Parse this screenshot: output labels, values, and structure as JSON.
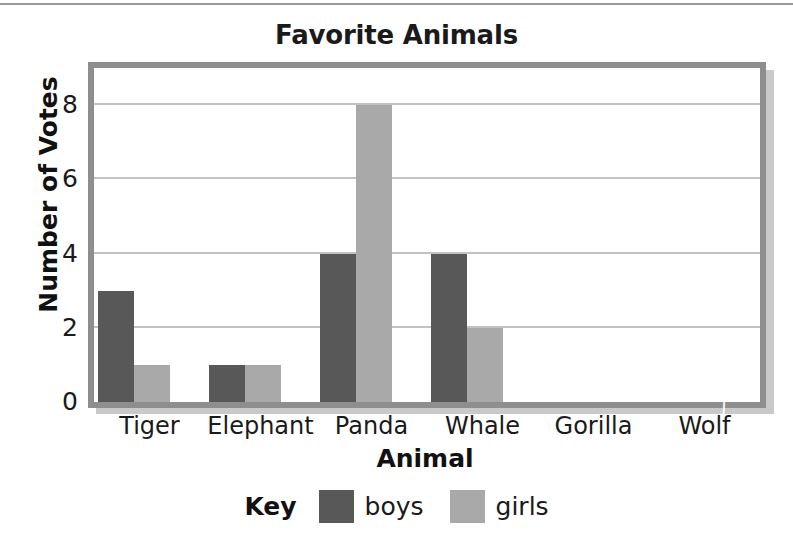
{
  "chart_data": {
    "type": "bar",
    "title": "Favorite Animals",
    "xlabel": "Animal",
    "ylabel": "Number of Votes",
    "categories": [
      "Tiger",
      "Elephant",
      "Panda",
      "Whale",
      "Gorilla",
      "Wolf"
    ],
    "series": [
      {
        "name": "boys",
        "values": [
          3,
          1,
          4,
          4,
          0,
          0
        ],
        "color": "#585858"
      },
      {
        "name": "girls",
        "values": [
          1,
          1,
          8,
          2,
          0,
          0
        ],
        "color": "#a9a9a9"
      }
    ],
    "ylim": [
      0,
      9
    ],
    "yticks": [
      0,
      2,
      4,
      6,
      8
    ],
    "ytick_labels": [
      "0",
      "2",
      "4",
      "6",
      "8"
    ],
    "grid": true,
    "legend_position": "bottom",
    "legend_title": "Key"
  },
  "legend": {
    "key_label": "Key",
    "items": [
      {
        "label": "boys",
        "color": "#585858"
      },
      {
        "label": "girls",
        "color": "#a9a9a9"
      }
    ]
  },
  "axis": {
    "break_marker": "∫"
  }
}
